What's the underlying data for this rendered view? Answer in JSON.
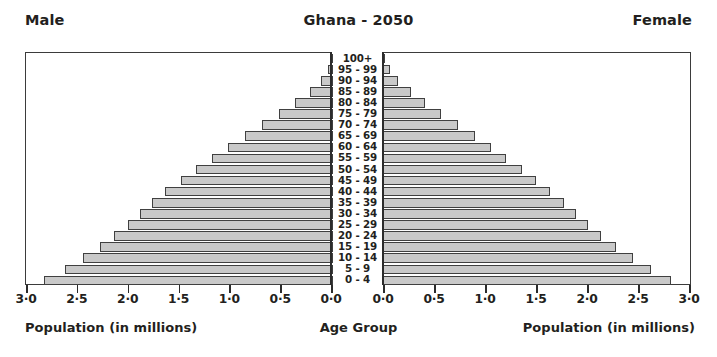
{
  "header": {
    "left_label": "Male",
    "title": "Ghana - 2050",
    "right_label": "Female"
  },
  "captions": {
    "left": "Population (in millions)",
    "center": "Age Group",
    "right": "Population (in millions)"
  },
  "axis": {
    "tick_labels_left": [
      "3·0",
      "2·5",
      "2·0",
      "1·5",
      "1·0",
      "0·5",
      "0·0"
    ],
    "tick_labels_right": [
      "0·0",
      "0·5",
      "1·0",
      "1·5",
      "2·0",
      "2·5",
      "3·0"
    ],
    "tick_values_left": [
      3.0,
      2.5,
      2.0,
      1.5,
      1.0,
      0.5,
      0.0
    ],
    "tick_values_right": [
      0.0,
      0.5,
      1.0,
      1.5,
      2.0,
      2.5,
      3.0
    ]
  },
  "style": {
    "bar_fill": "#c9c9c9",
    "bar_stroke": "#404040",
    "frame": "#3b3b3b",
    "text": "#231f20",
    "background": "#ffffff"
  },
  "chart_data": {
    "type": "bar",
    "subtype": "population-pyramid",
    "title": "Ghana - 2050",
    "xlabel": "Population (in millions)",
    "ylabel": "Age Group",
    "xlim": [
      0,
      3.0
    ],
    "grid": false,
    "legend": [
      "Male",
      "Female"
    ],
    "legend_position": "top-left and top-right",
    "categories": [
      "0 - 4",
      "5 - 9",
      "10 - 14",
      "15 - 19",
      "20 - 24",
      "25 - 29",
      "30 - 34",
      "35 - 39",
      "40 - 44",
      "45 - 49",
      "50 - 54",
      "55 - 59",
      "60 - 64",
      "65 - 69",
      "70 - 74",
      "75 - 79",
      "80 - 84",
      "85 - 89",
      "90 - 94",
      "95 - 99",
      "100+"
    ],
    "series": [
      {
        "name": "Male",
        "side": "left",
        "values": [
          2.84,
          2.64,
          2.46,
          2.29,
          2.15,
          2.02,
          1.9,
          1.78,
          1.65,
          1.5,
          1.35,
          1.19,
          1.03,
          0.87,
          0.7,
          0.53,
          0.37,
          0.23,
          0.12,
          0.05,
          0.01
        ]
      },
      {
        "name": "Female",
        "side": "right",
        "values": [
          2.82,
          2.63,
          2.45,
          2.28,
          2.14,
          2.01,
          1.89,
          1.77,
          1.64,
          1.5,
          1.36,
          1.21,
          1.06,
          0.9,
          0.74,
          0.57,
          0.41,
          0.27,
          0.15,
          0.07,
          0.02
        ]
      }
    ]
  }
}
